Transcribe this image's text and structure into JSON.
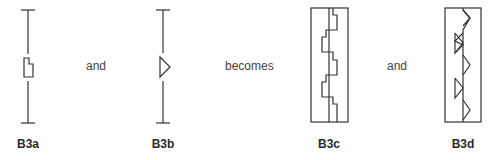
{
  "figures": [
    {
      "id": "b3a",
      "label": "B3a"
    },
    {
      "id": "b3b",
      "label": "B3b"
    },
    {
      "id": "b3c",
      "label": "B3c"
    },
    {
      "id": "b3d",
      "label": "B3d"
    }
  ],
  "connectors": [
    "and",
    "becomes",
    "and"
  ],
  "colors": {
    "stroke": "#333333",
    "text": "#444444"
  }
}
